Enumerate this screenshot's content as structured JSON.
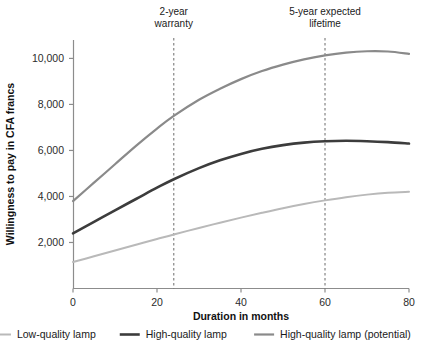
{
  "chart_data": {
    "type": "line",
    "title": "",
    "xlabel": "Duration in months",
    "ylabel": "Willingness to pay in CFA francs",
    "xlim": [
      0,
      80
    ],
    "ylim": [
      0,
      10800
    ],
    "grid": false,
    "legend_position": "bottom",
    "xticks": [
      0,
      20,
      40,
      60,
      80
    ],
    "xtick_labels": [
      "0",
      "20",
      "40",
      "60",
      "80"
    ],
    "yticks": [
      2000,
      4000,
      6000,
      8000,
      10000
    ],
    "ytick_labels": [
      "2,000",
      "4,000",
      "6,000",
      "8,000",
      "10,000"
    ],
    "x": [
      0,
      5,
      10,
      15,
      20,
      24,
      30,
      35,
      40,
      45,
      50,
      55,
      60,
      65,
      70,
      75,
      80
    ],
    "series": [
      {
        "name": "Low-quality lamp",
        "color": "#b9b9b9",
        "width": 2,
        "values": [
          1150,
          1400,
          1650,
          1900,
          2150,
          2350,
          2630,
          2860,
          3080,
          3290,
          3490,
          3670,
          3830,
          3970,
          4080,
          4160,
          4200
        ]
      },
      {
        "name": "High-quality lamp",
        "color": "#3c3c3c",
        "width": 2.6,
        "values": [
          2400,
          2900,
          3400,
          3890,
          4380,
          4750,
          5230,
          5570,
          5850,
          6070,
          6230,
          6340,
          6400,
          6420,
          6400,
          6360,
          6300
        ]
      },
      {
        "name": "High-quality lamp (potential)",
        "color": "#8a8a8a",
        "width": 2.2,
        "values": [
          3800,
          4600,
          5400,
          6200,
          6950,
          7500,
          8200,
          8680,
          9100,
          9450,
          9730,
          9960,
          10130,
          10250,
          10310,
          10300,
          10200
        ]
      }
    ],
    "annotations": [
      {
        "x": 24,
        "label_line1": "2-year",
        "label_line2": "warranty",
        "style": "dashed-vline",
        "color": "#6b6b6b"
      },
      {
        "x": 60,
        "label_line1": "5-year expected",
        "label_line2": "lifetime",
        "style": "dashed-vline",
        "color": "#6b6b6b"
      }
    ]
  },
  "legend": {
    "items": [
      {
        "label": "Low-quality lamp",
        "color": "#b9b9b9"
      },
      {
        "label": "High-quality lamp",
        "color": "#3c3c3c"
      },
      {
        "label": "High-quality lamp (potential)",
        "color": "#8a8a8a"
      }
    ]
  },
  "axis_color": "#8c8c8c"
}
